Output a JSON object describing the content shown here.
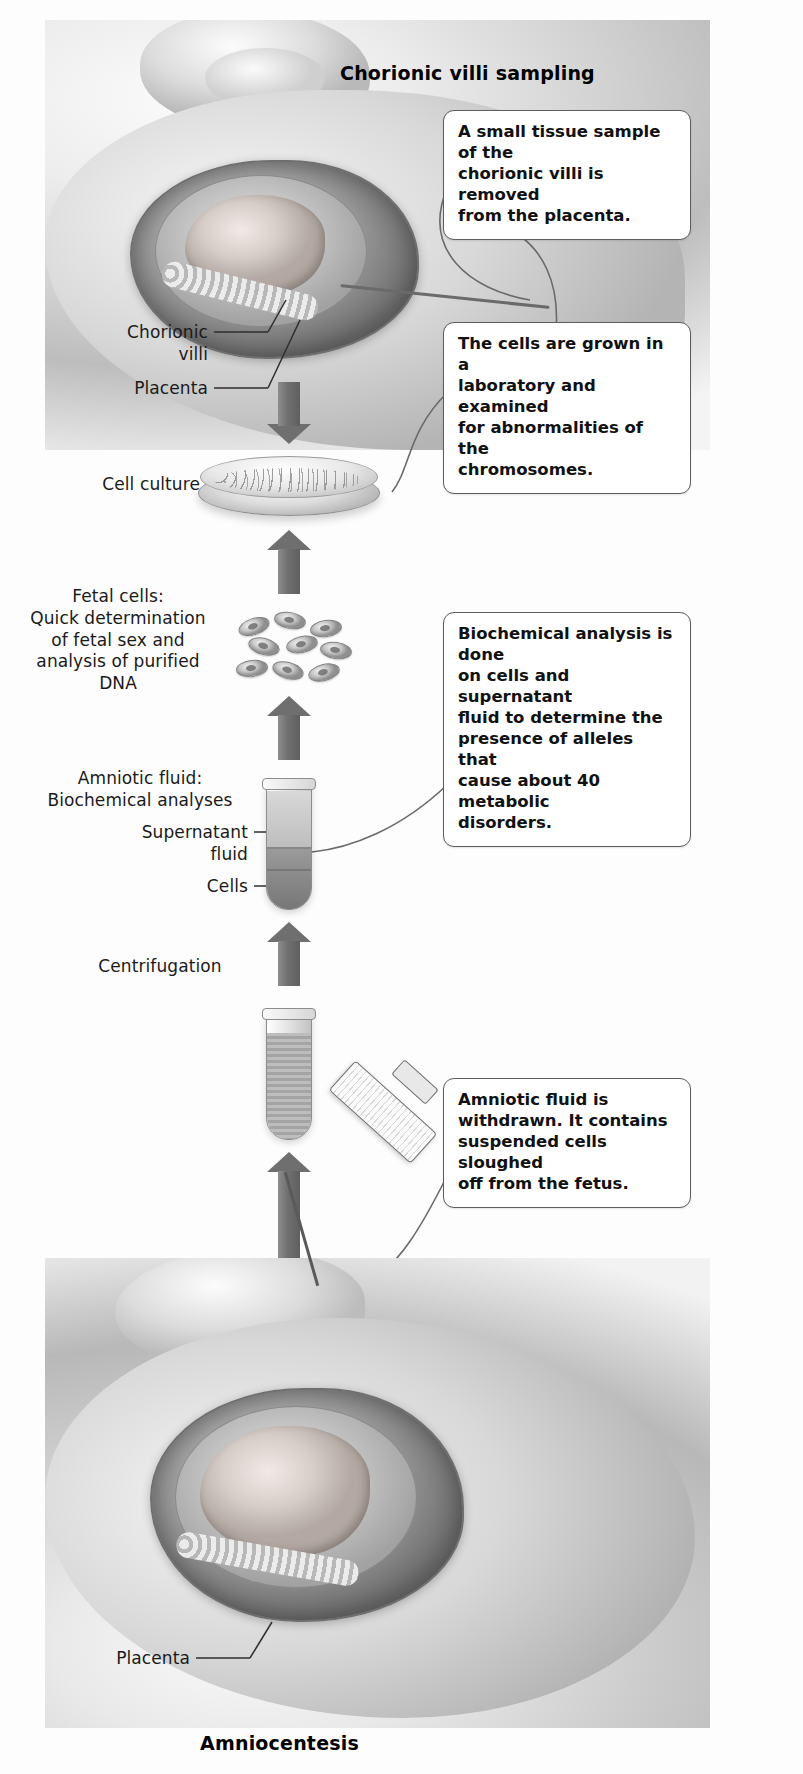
{
  "figure": {
    "top_title": "Chorionic villi sampling",
    "bottom_title": "Amniocentesis"
  },
  "callouts": [
    {
      "id": "cvs-sample",
      "text": "A small tissue sample of the\nchorionic villi is removed\nfrom the placenta."
    },
    {
      "id": "cell-culture",
      "text": "The cells are grown in a\nlaboratory and examined\nfor abnormalities of the\nchromosomes."
    },
    {
      "id": "biochemical",
      "text": "Biochemical analysis is done\non cells and supernatant\nfluid to determine the\npresence of alleles that\ncause about 40 metabolic\ndisorders."
    },
    {
      "id": "amniotic-fluid",
      "text": "Amniotic fluid is\nwithdrawn. It contains\nsuspended cells sloughed\noff from the fetus."
    }
  ],
  "labels": {
    "chorionic_villi": "Chorionic\nvilli",
    "placenta_top": "Placenta",
    "cell_culture": "Cell culture",
    "fetal_cells": "Fetal cells:\nQuick determination\nof fetal sex and\nanalysis of purified\nDNA",
    "amniotic_fluid": "Amniotic fluid:\nBiochemical analyses",
    "supernatant_fluid": "Supernatant\nfluid",
    "cells": "Cells",
    "centrifugation": "Centrifugation",
    "placenta_bottom": "Placenta"
  },
  "colors": {
    "arrow": "#6f6f6f",
    "callout_border": "#5d5d5d",
    "text": "#1a1a1a",
    "background": "#fdfdfd"
  }
}
